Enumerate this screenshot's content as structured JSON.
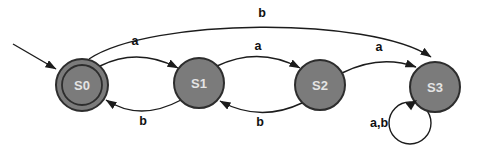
{
  "diagram": {
    "kind": "finite-state-machine",
    "colors": {
      "background": "#ffffff",
      "state_fill": "#7b7b7b",
      "state_stroke": "#2d2d2d",
      "state_label": "#e4e4e4",
      "edge": "#1c1c1c",
      "edge_label": "#111111"
    },
    "states": [
      {
        "id": "S0",
        "label": "S0",
        "x": 82,
        "y": 85,
        "r": 26,
        "double": true,
        "inner_r": 20,
        "start": true,
        "note": "start state, double circle (accepting)"
      },
      {
        "id": "S1",
        "label": "S1",
        "x": 199,
        "y": 83,
        "r": 25,
        "double": false
      },
      {
        "id": "S2",
        "label": "S2",
        "x": 320,
        "y": 85,
        "r": 25,
        "double": false
      },
      {
        "id": "S3",
        "label": "S3",
        "x": 435,
        "y": 87,
        "r": 25,
        "double": false
      }
    ],
    "start_arrow": {
      "target": "S0",
      "x1": 13,
      "y1": 44,
      "x2": 56,
      "y2": 69
    },
    "transitions": [
      {
        "from": "S0",
        "to": "S1",
        "label": "a",
        "path": "M 100,66 Q 138,47 178,68",
        "label_x": 135,
        "label_y": 45
      },
      {
        "from": "S1",
        "to": "S0",
        "label": "b",
        "path": "M 181,100 Q 140,122 106,100",
        "label_x": 143,
        "label_y": 125
      },
      {
        "from": "S1",
        "to": "S2",
        "label": "a",
        "path": "M 217,66 Q 259,46 300,68",
        "label_x": 258,
        "label_y": 50
      },
      {
        "from": "S2",
        "to": "S1",
        "label": "b",
        "path": "M 302,103 Q 260,123 220,101",
        "label_x": 260,
        "label_y": 126
      },
      {
        "from": "S2",
        "to": "S3",
        "label": "a",
        "path": "M 342,73 Q 380,54 416,67",
        "label_x": 379,
        "label_y": 51
      },
      {
        "from": "S0",
        "to": "S3",
        "label": "b",
        "path": "M 89,59 C 150,18 370,16 431,57",
        "label_x": 262,
        "label_y": 17
      },
      {
        "from": "S3",
        "to": "S3",
        "label": "a,b",
        "label_x": 379,
        "label_y": 127,
        "loop": {
          "cx": 410,
          "cy": 123,
          "r": 21,
          "tip_x": 417,
          "tip_y": 100,
          "tip_angle": -38
        }
      }
    ]
  }
}
